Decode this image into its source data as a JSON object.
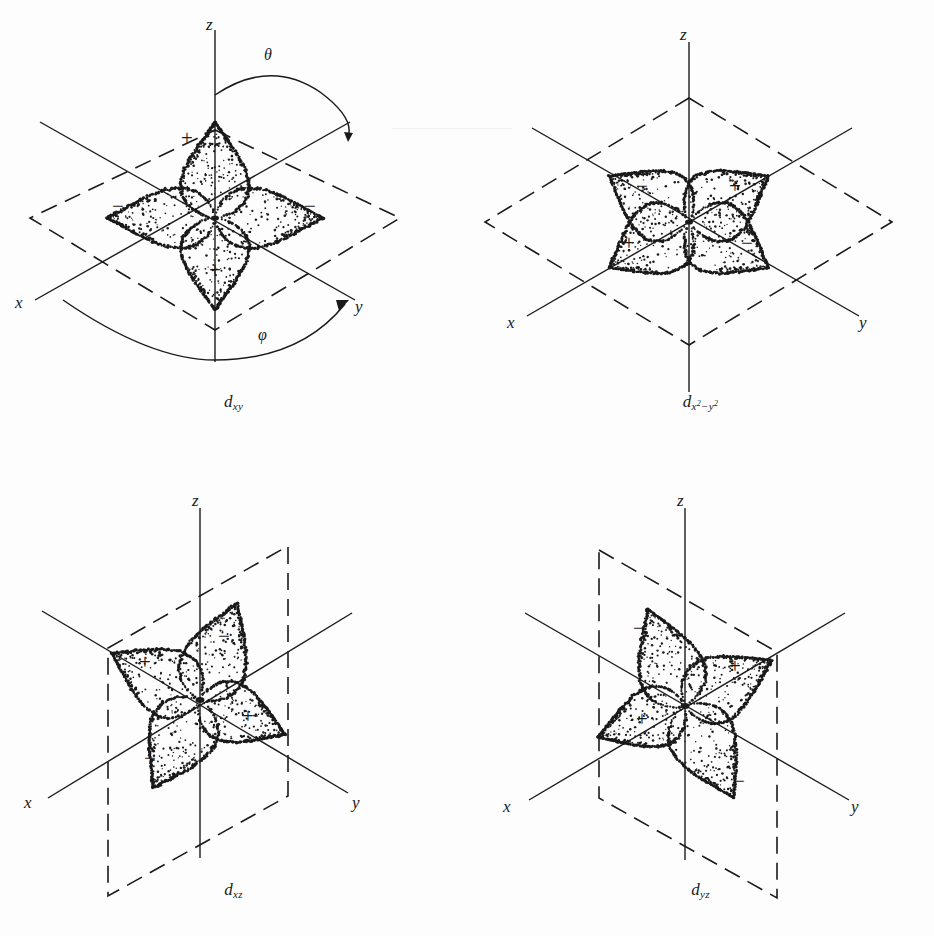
{
  "figure": {
    "background_color": "#fdfdfd",
    "ink_color": "#1a1a1a",
    "panel_count": 4
  },
  "axes": {
    "x_label": "x",
    "y_label": "y",
    "z_label": "z"
  },
  "angles": {
    "theta_label": "θ",
    "phi_label": "φ"
  },
  "signs": {
    "positive": "+",
    "negative": "−"
  },
  "panels": [
    {
      "id": "dxy",
      "label_base": "d",
      "label_sub": "xy",
      "plane": "horizontal-xy",
      "plane_style": "dashed-rhombus",
      "lobe_orientation": "between-axes",
      "has_theta": true,
      "has_phi": true,
      "lobes": [
        {
          "position": "top",
          "sign": "+"
        },
        {
          "position": "left",
          "sign": "−"
        },
        {
          "position": "right",
          "sign": "−"
        },
        {
          "position": "bottom",
          "sign": "+"
        }
      ]
    },
    {
      "id": "dx2-y2",
      "label_base": "d",
      "label_sub": "x2−y2",
      "plane": "horizontal-xy",
      "plane_style": "dashed-rhombus",
      "lobe_orientation": "along-axes",
      "has_theta": false,
      "has_phi": false,
      "lobes": [
        {
          "position": "upper-left",
          "sign": "−"
        },
        {
          "position": "upper-right",
          "sign": "+"
        },
        {
          "position": "lower-left",
          "sign": "+"
        },
        {
          "position": "lower-right",
          "sign": "−"
        }
      ]
    },
    {
      "id": "dxz",
      "label_base": "d",
      "label_sub": "xz",
      "plane": "vertical-xz",
      "plane_style": "dashed-parallelogram",
      "lobe_orientation": "between-axes",
      "has_theta": false,
      "has_phi": false,
      "lobes": [
        {
          "position": "upper-left",
          "sign": "+"
        },
        {
          "position": "upper-right",
          "sign": "−"
        },
        {
          "position": "lower-left",
          "sign": "−"
        },
        {
          "position": "lower-right",
          "sign": "+"
        }
      ]
    },
    {
      "id": "dyz",
      "label_base": "d",
      "label_sub": "yz",
      "plane": "vertical-yz",
      "plane_style": "dashed-parallelogram",
      "lobe_orientation": "between-axes",
      "has_theta": false,
      "has_phi": false,
      "lobes": [
        {
          "position": "upper-left",
          "sign": "−"
        },
        {
          "position": "upper-right",
          "sign": "+"
        },
        {
          "position": "lower-left",
          "sign": "+"
        },
        {
          "position": "lower-right",
          "sign": "−"
        }
      ]
    }
  ]
}
